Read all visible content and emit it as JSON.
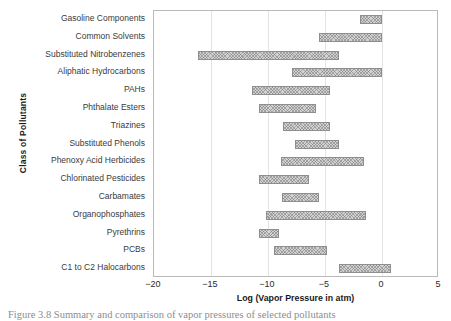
{
  "figure": {
    "caption": "Figure 3.8    Summary and comparison of vapor pressures of selected pollutants"
  },
  "chart_data": {
    "type": "bar",
    "orientation": "horizontal",
    "subtype": "range-bar",
    "title": "",
    "xlabel": "Log (Vapor Pressure in atm)",
    "ylabel": "Class of Pollutants",
    "xlim": [
      -20,
      5
    ],
    "ylim": [
      0,
      15
    ],
    "grid": "vertical",
    "legend": "none",
    "xticks": [
      -20,
      -15,
      -10,
      -5,
      0,
      5
    ],
    "xtick_labels": [
      "−20",
      "−15",
      "−10",
      "−5",
      "0",
      "5"
    ],
    "categories": [
      "Gasoline Components",
      "Common Solvents",
      "Substituted Nitrobenzenes",
      "Aliphatic Hydrocarbons",
      "PAHs",
      "Phthalate Esters",
      "Triazines",
      "Substituted Phenols",
      "Phenoxy Acid Herbicides",
      "Chlorinated Pesticides",
      "Carbamates",
      "Organophosphates",
      "Pyrethrins",
      "PCBs",
      "C1 to C2 Halocarbons"
    ],
    "ranges": [
      {
        "category": "Gasoline Components",
        "start": -1.9,
        "end": 0.0
      },
      {
        "category": "Common Solvents",
        "start": -5.5,
        "end": 0.0
      },
      {
        "category": "Substituted Nitrobenzenes",
        "start": -16.1,
        "end": -3.8
      },
      {
        "category": "Aliphatic Hydrocarbons",
        "start": -7.9,
        "end": 0.0
      },
      {
        "category": "PAHs",
        "start": -11.4,
        "end": -4.6
      },
      {
        "category": "Phthalate Esters",
        "start": -10.8,
        "end": -5.8
      },
      {
        "category": "Triazines",
        "start": -8.7,
        "end": -4.6
      },
      {
        "category": "Substituted Phenols",
        "start": -7.6,
        "end": -3.8
      },
      {
        "category": "Phenoxy Acid Herbicides",
        "start": -8.9,
        "end": -1.6
      },
      {
        "category": "Chlorinated Pesticides",
        "start": -10.8,
        "end": -6.4
      },
      {
        "category": "Carbamates",
        "start": -8.8,
        "end": -5.5
      },
      {
        "category": "Organophosphates",
        "start": -10.2,
        "end": -1.4
      },
      {
        "category": "Pyrethrins",
        "start": -10.8,
        "end": -9.0
      },
      {
        "category": "PCBs",
        "start": -9.5,
        "end": -4.8
      },
      {
        "category": "C1 to C2 Halocarbons",
        "start": -3.8,
        "end": 0.8
      }
    ],
    "colors": {
      "bar_fill": "#d2d2d2",
      "bar_edge": "#8e8e8e",
      "grid": "#e4e4e4",
      "axis": "#b9b9b9",
      "text": "#2b2b2b"
    }
  }
}
